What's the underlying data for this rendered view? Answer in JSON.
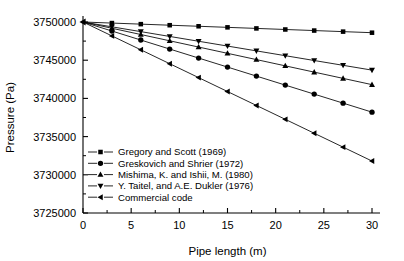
{
  "chart_data": {
    "type": "line",
    "title": "",
    "xlabel": "Pipe length (m)",
    "ylabel": "Pressure (Pa)",
    "xlim": [
      0,
      30
    ],
    "ylim": [
      3725000,
      3750000
    ],
    "xticks": [
      0,
      5,
      10,
      15,
      20,
      25,
      30
    ],
    "xticklabels": [
      "0",
      "5",
      "10",
      "15",
      "20",
      "25",
      "30"
    ],
    "yticks": [
      3725000,
      3730000,
      3735000,
      3740000,
      3745000,
      3750000
    ],
    "yticklabels": [
      "3725000",
      "3730000",
      "3735000",
      "3740000",
      "3745000",
      "3750000"
    ],
    "minor_ticks": true,
    "grid": false,
    "legend_position": "lower left",
    "x": [
      0,
      3,
      6,
      9,
      12,
      15,
      18,
      21,
      24,
      27,
      30
    ],
    "series": [
      {
        "name": "Gregory and Scott (1969)",
        "marker": "square",
        "values": [
          3750000,
          3749860,
          3749720,
          3749580,
          3749440,
          3749300,
          3749160,
          3749020,
          3748880,
          3748740,
          3748600
        ]
      },
      {
        "name": "Greskovich and Shrier (1972)",
        "marker": "circle",
        "values": [
          3750000,
          3748820,
          3747640,
          3746460,
          3745280,
          3744100,
          3742920,
          3741740,
          3740560,
          3739380,
          3738200
        ]
      },
      {
        "name": "Mishima, K. and Ishii, M. (1980)",
        "marker": "triangle-up",
        "values": [
          3750000,
          3749180,
          3748360,
          3747540,
          3746720,
          3745900,
          3745080,
          3744260,
          3743440,
          3742620,
          3741800
        ]
      },
      {
        "name": "Y. Taitel, and A.E. Dukler (1976)",
        "marker": "triangle-down",
        "values": [
          3750000,
          3749370,
          3748740,
          3748110,
          3747480,
          3746850,
          3746220,
          3745590,
          3744960,
          3744330,
          3743700
        ]
      },
      {
        "name": "Commercial code",
        "marker": "triangle-left",
        "values": [
          3750000,
          3748180,
          3746360,
          3744540,
          3742720,
          3740900,
          3739080,
          3737260,
          3735440,
          3733620,
          3731800
        ]
      }
    ]
  }
}
